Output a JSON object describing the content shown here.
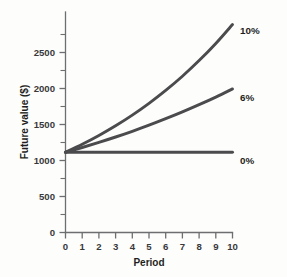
{
  "chart_data": {
    "type": "line",
    "title": "",
    "subtitle": "",
    "xlabel": "Period",
    "ylabel": "Future value ($)",
    "xlim": [
      0,
      10
    ],
    "ylim": [
      0,
      2750
    ],
    "grid": false,
    "legend_position": "right-of-curve-ends",
    "x_ticks": [
      0,
      1,
      2,
      3,
      4,
      5,
      6,
      7,
      8,
      9,
      10
    ],
    "x_ticklabels": [
      "0",
      "1",
      "2",
      "3",
      "4",
      "5",
      "6",
      "7",
      "8",
      "9",
      "10"
    ],
    "y_ticks_major": [
      0,
      500,
      1000,
      1500,
      2000,
      2500
    ],
    "y_ticklabels": [
      "0",
      "500",
      "1000",
      "1500",
      "2000",
      "2500"
    ],
    "y_ticks_minor": [
      250,
      750,
      1250,
      1750,
      2250,
      2750
    ],
    "x": [
      0,
      1,
      2,
      3,
      4,
      5,
      6,
      7,
      8,
      9,
      10
    ],
    "series": [
      {
        "name": "10%",
        "rate": 0.1,
        "label": "10%",
        "color": "#4b4b4d",
        "values": [
          1000,
          1100,
          1210,
          1331,
          1464,
          1611,
          1772,
          1949,
          2144,
          2358,
          2594
        ]
      },
      {
        "name": "6%",
        "rate": 0.06,
        "label": "6%",
        "color": "#4b4b4d",
        "values": [
          1000,
          1060,
          1124,
          1191,
          1262,
          1338,
          1419,
          1504,
          1594,
          1689,
          1791
        ]
      },
      {
        "name": "0%",
        "rate": 0.0,
        "label": "0%",
        "color": "#4b4b4d",
        "values": [
          1000,
          1000,
          1000,
          1000,
          1000,
          1000,
          1000,
          1000,
          1000,
          1000,
          1000
        ]
      }
    ]
  },
  "colors": {
    "background": "#fdfdfc",
    "axis": "#6d6e70",
    "curve": "#4b4b4d",
    "text": "#1f1f21"
  }
}
